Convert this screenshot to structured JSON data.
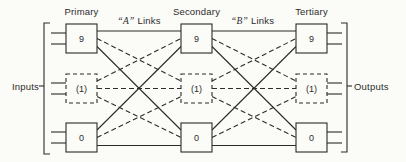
{
  "stages": [
    {
      "label": "Primary",
      "boxes": [
        "9",
        "(1)",
        "0"
      ]
    },
    {
      "label": "Secondary",
      "boxes": [
        "9",
        "(1)",
        "0"
      ]
    },
    {
      "label": "Tertiary",
      "boxes": [
        "9",
        "(1)",
        "0"
      ]
    }
  ],
  "links": {
    "a": {
      "letter": "“A”",
      "word": "Links"
    },
    "b": {
      "letter": "“B”",
      "word": "Links"
    }
  },
  "io": {
    "left": "Inputs",
    "right": "Outputs"
  },
  "colors": {
    "ink": "#2b2b2b",
    "paper": "#fbfbf8"
  }
}
